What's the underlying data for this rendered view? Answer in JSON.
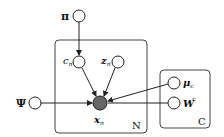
{
  "diagram": {
    "type": "probabilistic-graphical-model",
    "nodes": {
      "pi": {
        "label": "π",
        "observed": false
      },
      "c": {
        "label": "c",
        "sub": "n",
        "observed": false
      },
      "z": {
        "label": "z",
        "sub": "n",
        "observed": false
      },
      "x": {
        "label": "x",
        "sub": "n",
        "observed": true
      },
      "psi": {
        "label": "Ψ",
        "observed": false
      },
      "mu": {
        "label": "μ",
        "sub": "c",
        "observed": false
      },
      "w": {
        "label": "W",
        "sub": "c",
        "observed": false
      }
    },
    "plates": {
      "n": {
        "label": "N"
      },
      "c": {
        "label": "C"
      }
    },
    "edges": [
      [
        "π",
        "c_n"
      ],
      [
        "c_n",
        "x_n"
      ],
      [
        "z_n",
        "x_n"
      ],
      [
        "Ψ",
        "x_n"
      ],
      [
        "μ_c",
        "x_n"
      ],
      [
        "W_c",
        "x_n"
      ]
    ],
    "colors": {
      "observed_fill": "#666666",
      "stroke": "#222222"
    }
  }
}
